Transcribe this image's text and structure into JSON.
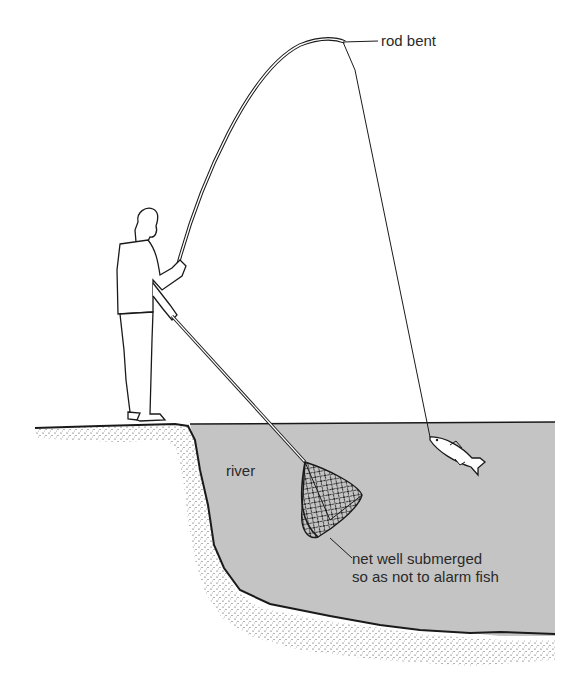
{
  "figure": {
    "colors": {
      "background": "#ffffff",
      "water": "#c4c4c4",
      "ink": "#1a1a1a",
      "label_text": "#2a2a2a"
    }
  },
  "labels": {
    "rod": "rod bent",
    "river": "river",
    "net_line1": "net well submerged",
    "net_line2": "so as not to alarm fish"
  },
  "elements": {
    "angler": "person standing on bank",
    "rod": "fishing rod bent by hooked fish",
    "line": "fishing line",
    "fish": "hooked fish",
    "net": "landing net",
    "bank": "river bank",
    "water": "river water"
  }
}
